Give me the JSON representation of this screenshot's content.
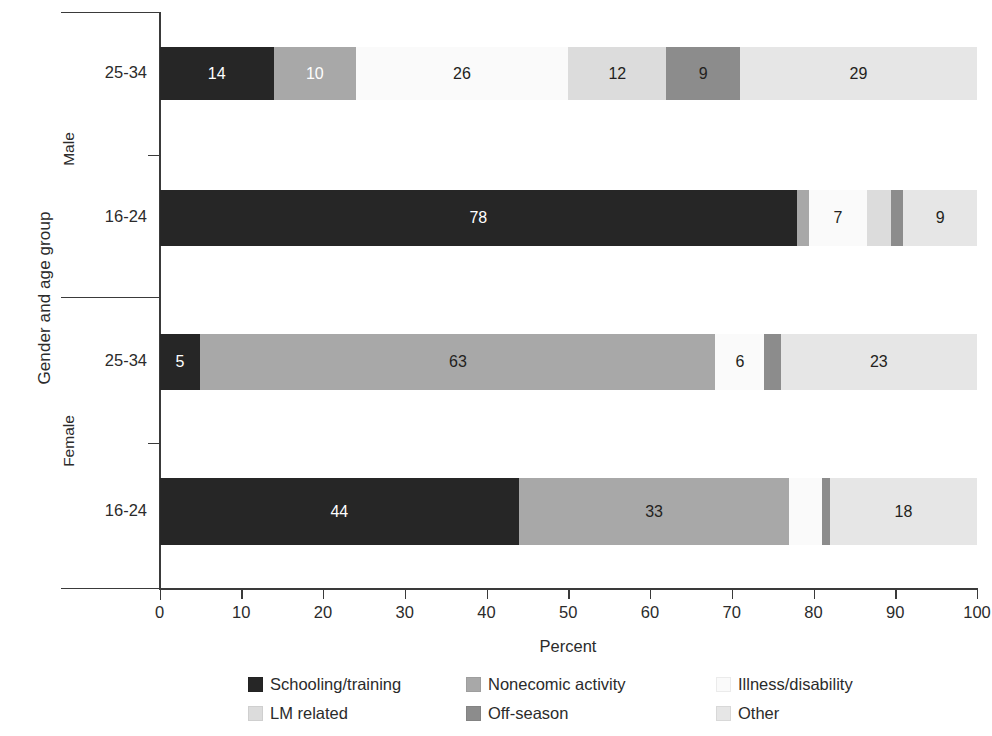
{
  "chart_data": {
    "type": "bar",
    "subtype": "stacked-horizontal-100",
    "title": "",
    "xlabel": "Percent",
    "ylabel": "Gender and age group",
    "xlim": [
      0,
      100
    ],
    "xticks": [
      0,
      10,
      20,
      30,
      40,
      50,
      60,
      70,
      80,
      90,
      100
    ],
    "grid": false,
    "legend_position": "bottom",
    "groups": [
      "Male",
      "Female"
    ],
    "categories": [
      "25-34",
      "16-24",
      "25-34",
      "16-24"
    ],
    "series": [
      {
        "name": "Schooling/training",
        "color": "#262626",
        "values": [
          14,
          78,
          5,
          44
        ]
      },
      {
        "name": "Nonecomic activity",
        "color": "#a8a8a8",
        "values": [
          10,
          1,
          63,
          33
        ]
      },
      {
        "name": "Illness/disability",
        "color": "#fafafa",
        "values": [
          26,
          7,
          6,
          4
        ]
      },
      {
        "name": "LM related",
        "color": "#dcdcdc",
        "values": [
          12,
          3,
          0,
          0
        ]
      },
      {
        "name": "Off-season",
        "color": "#8c8c8c",
        "values": [
          9,
          1,
          2,
          1
        ]
      },
      {
        "name": "Other",
        "color": "#e6e6e6",
        "values": [
          29,
          10,
          24,
          18
        ]
      }
    ],
    "bars": [
      {
        "group": "Male",
        "category": "25-34",
        "segments": [
          {
            "series": "Schooling/training",
            "value": 14,
            "label": "14",
            "color": "#262626",
            "text": "light"
          },
          {
            "series": "Nonecomic activity",
            "value": 10,
            "label": "10",
            "color": "#a8a8a8",
            "text": "light"
          },
          {
            "series": "Illness/disability",
            "value": 26,
            "label": "26",
            "color": "#fafafa",
            "text": "dark"
          },
          {
            "series": "LM related",
            "value": 12,
            "label": "12",
            "color": "#dcdcdc",
            "text": "dark"
          },
          {
            "series": "Off-season",
            "value": 9,
            "label": "9",
            "color": "#8c8c8c",
            "text": "dark"
          },
          {
            "series": "Other",
            "value": 29,
            "label": "29",
            "color": "#e6e6e6",
            "text": "dark"
          }
        ]
      },
      {
        "group": "Male",
        "category": "16-24",
        "segments": [
          {
            "series": "Schooling/training",
            "value": 78,
            "label": "78",
            "color": "#262626",
            "text": "light"
          },
          {
            "series": "Nonecomic activity",
            "value": 1.5,
            "label": "",
            "color": "#a8a8a8",
            "text": "dark"
          },
          {
            "series": "Illness/disability",
            "value": 7,
            "label": "7",
            "color": "#fafafa",
            "text": "dark"
          },
          {
            "series": "LM related",
            "value": 3,
            "label": "",
            "color": "#dcdcdc",
            "text": "dark"
          },
          {
            "series": "Off-season",
            "value": 1.5,
            "label": "",
            "color": "#8c8c8c",
            "text": "dark"
          },
          {
            "series": "Other",
            "value": 9,
            "label": "9",
            "color": "#e6e6e6",
            "text": "dark"
          }
        ]
      },
      {
        "group": "Female",
        "category": "25-34",
        "segments": [
          {
            "series": "Schooling/training",
            "value": 5,
            "label": "5",
            "color": "#262626",
            "text": "light"
          },
          {
            "series": "Nonecomic activity",
            "value": 63,
            "label": "63",
            "color": "#a8a8a8",
            "text": "dark"
          },
          {
            "series": "Illness/disability",
            "value": 6,
            "label": "6",
            "color": "#fafafa",
            "text": "dark"
          },
          {
            "series": "Off-season",
            "value": 2,
            "label": "",
            "color": "#8c8c8c",
            "text": "dark"
          },
          {
            "series": "Other",
            "value": 24,
            "label": "23",
            "color": "#e6e6e6",
            "text": "dark"
          }
        ]
      },
      {
        "group": "Female",
        "category": "16-24",
        "segments": [
          {
            "series": "Schooling/training",
            "value": 44,
            "label": "44",
            "color": "#262626",
            "text": "light"
          },
          {
            "series": "Nonecomic activity",
            "value": 33,
            "label": "33",
            "color": "#a8a8a8",
            "text": "dark"
          },
          {
            "series": "Illness/disability",
            "value": 4,
            "label": "",
            "color": "#fafafa",
            "text": "dark"
          },
          {
            "series": "Off-season",
            "value": 1,
            "label": "",
            "color": "#8c8c8c",
            "text": "dark"
          },
          {
            "series": "Other",
            "value": 18,
            "label": "18",
            "color": "#e6e6e6",
            "text": "dark"
          }
        ]
      }
    ],
    "legend": [
      {
        "label": "Schooling/training",
        "color": "#262626"
      },
      {
        "label": "Nonecomic activity",
        "color": "#a8a8a8"
      },
      {
        "label": "Illness/disability",
        "color": "#fafafa"
      },
      {
        "label": "LM related",
        "color": "#dcdcdc"
      },
      {
        "label": "Off-season",
        "color": "#8c8c8c"
      },
      {
        "label": "Other",
        "color": "#e6e6e6"
      }
    ]
  },
  "axis": {
    "y_title": "Gender and age group",
    "x_title": "Percent",
    "group_labels": [
      "Male",
      "Female"
    ],
    "category_labels": [
      "25-34",
      "16-24",
      "25-34",
      "16-24"
    ],
    "x_tick_labels": [
      "0",
      "10",
      "20",
      "30",
      "40",
      "50",
      "60",
      "70",
      "80",
      "90",
      "100"
    ]
  },
  "legend_display": {
    "row1": [
      "Schooling/training",
      "Nonecomic activity",
      "Illness/disability"
    ],
    "row2": [
      "LM related",
      "Off-season",
      "Other"
    ]
  }
}
